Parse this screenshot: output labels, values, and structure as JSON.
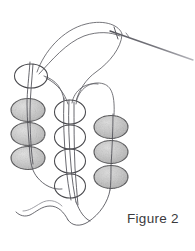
{
  "figure": {
    "caption": "Figure 2",
    "background_color": "#ffffff",
    "caption_color": "#3a3a3c"
  },
  "palette": {
    "thread_color": "#5d5d63",
    "thread_light": "#8f8f96",
    "bead_fill": "#c3c3c3",
    "bead_fill_light": "#dedede",
    "bead_outline": "#3f3f42",
    "open_bead_outline": "#4a4a4e",
    "needle_color": "#6e6e75"
  },
  "needle": {
    "name": "beading-needle",
    "tip_x": 193,
    "tip_y": 60,
    "eye_x": 122,
    "eye_y": 33,
    "label": "needle"
  },
  "bead_columns": [
    {
      "name": "left-column",
      "style": "filled",
      "center_x": 28,
      "bead_width": 34,
      "bead_height": 23,
      "count": 3,
      "centers_y": [
        110,
        134,
        158
      ]
    },
    {
      "name": "middle-column",
      "style": "open",
      "center_x": 70,
      "bead_width": 31,
      "bead_height": 24,
      "count": 4,
      "centers_y": [
        112,
        137,
        161,
        186
      ]
    },
    {
      "name": "right-column",
      "style": "filled",
      "center_x": 111,
      "bead_width": 34,
      "bead_height": 23,
      "count": 3,
      "centers_y": [
        127,
        152,
        177
      ]
    }
  ],
  "open_beads_extra": [
    {
      "name": "top-left-open-bead",
      "center_x": 31,
      "center_y": 76,
      "width": 33,
      "height": 24
    }
  ],
  "threads": [
    {
      "name": "needle-working-thread",
      "description": "thread from needle eye looping left"
    },
    {
      "name": "upper-loop-thread",
      "description": "large arc from top-left bead up and right to needle"
    },
    {
      "name": "left-column-thread",
      "description": "vertical thread through left column beads"
    },
    {
      "name": "middle-column-thread",
      "description": "vertical thread through middle open beads"
    },
    {
      "name": "right-column-thread",
      "description": "arc thread over to right column beads"
    },
    {
      "name": "bottom-tail-thread",
      "description": "loose thread tail curving at bottom left"
    },
    {
      "name": "bottom-right-loop-thread",
      "description": "thread exiting bottom right bead"
    }
  ]
}
